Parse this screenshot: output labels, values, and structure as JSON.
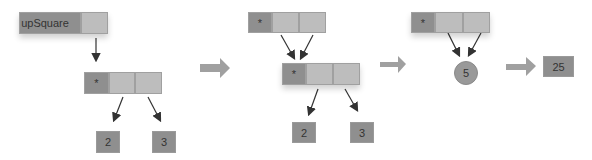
{
  "stages": [
    {
      "head": {
        "label": "upSquare"
      },
      "node": {
        "label": "*"
      },
      "leaves": [
        "2",
        "3"
      ]
    },
    {
      "top_node": {
        "label": "*"
      },
      "node": {
        "label": "*"
      },
      "leaves": [
        "2",
        "3"
      ]
    },
    {
      "top_node": {
        "label": "*"
      },
      "circle": {
        "label": "5"
      }
    },
    {
      "result": {
        "label": "25"
      }
    }
  ],
  "colors": {
    "dark": "#8f8f8f",
    "light": "#bdbdbd",
    "arrow": "#999999",
    "line": "#333333"
  }
}
